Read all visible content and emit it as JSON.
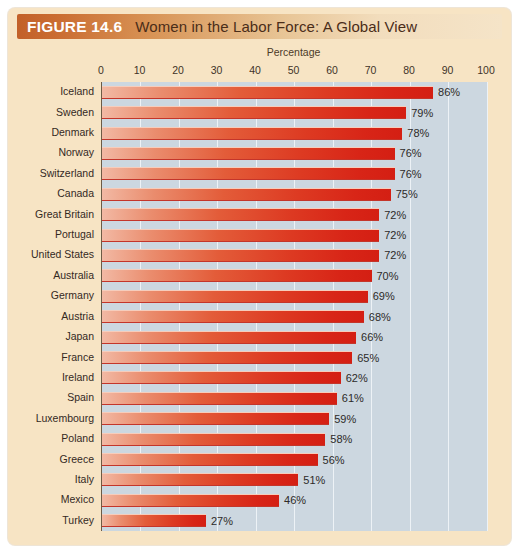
{
  "figure": {
    "number_label": "FIGURE 14.6",
    "title": "Women in the Labor Force:  A Global View"
  },
  "axis": {
    "title": "Percentage",
    "ticks": [
      "0",
      "10",
      "20",
      "30",
      "40",
      "50",
      "60",
      "70",
      "80",
      "90",
      "100"
    ]
  },
  "colors": {
    "header_start": "#c26029",
    "header_end": "#f5e4c8",
    "card_background": "#f7e4c4",
    "plot_background": "#ccd7e0",
    "gridline": "#edf2f6",
    "bar_light": "#f2b9a4",
    "bar_dark": "#d41f13"
  },
  "chart_data": {
    "type": "bar",
    "orientation": "horizontal",
    "title": "Women in the Labor Force:  A Global View",
    "xlabel": "Percentage",
    "ylabel": "",
    "xlim": [
      0,
      100
    ],
    "grid": true,
    "legend": "none",
    "categories": [
      "Iceland",
      "Sweden",
      "Denmark",
      "Norway",
      "Switzerland",
      "Canada",
      "Great Britain",
      "Portugal",
      "United States",
      "Australia",
      "Germany",
      "Austria",
      "Japan",
      "France",
      "Ireland",
      "Spain",
      "Luxembourg",
      "Poland",
      "Greece",
      "Italy",
      "Mexico",
      "Turkey"
    ],
    "values": [
      86,
      79,
      78,
      76,
      76,
      75,
      72,
      72,
      72,
      70,
      69,
      68,
      66,
      65,
      62,
      61,
      59,
      58,
      56,
      51,
      46,
      27
    ],
    "value_labels": [
      "86%",
      "79%",
      "78%",
      "76%",
      "76%",
      "75%",
      "72%",
      "72%",
      "72%",
      "70%",
      "69%",
      "68%",
      "66%",
      "65%",
      "62%",
      "61%",
      "59%",
      "58%",
      "56%",
      "51%",
      "46%",
      "27%"
    ]
  }
}
